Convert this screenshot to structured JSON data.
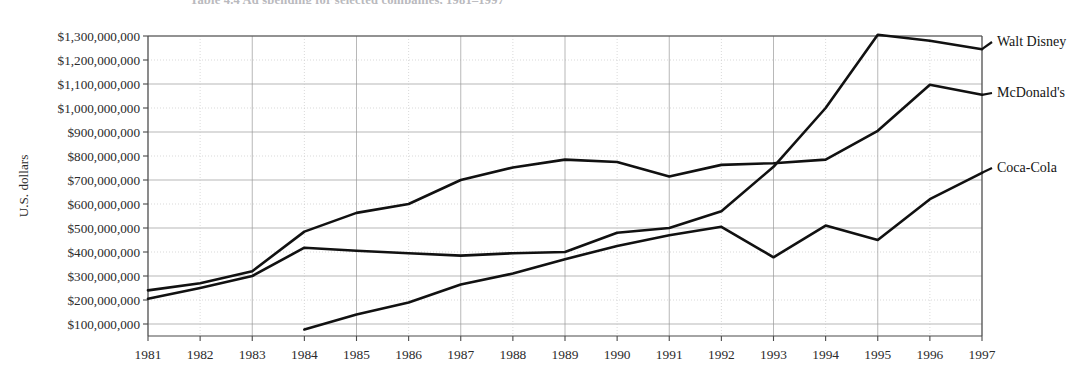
{
  "figure": {
    "caption": "Table 4.4   Ad spending for selected companies, 1981–1997"
  },
  "chart_data": {
    "type": "line",
    "title": "",
    "xlabel": "",
    "ylabel": "U.S. dollars",
    "x": [
      1981,
      1982,
      1983,
      1984,
      1985,
      1986,
      1987,
      1988,
      1989,
      1990,
      1991,
      1992,
      1993,
      1994,
      1995,
      1996,
      1997
    ],
    "xtick_labels": [
      "1981",
      "1982",
      "1983",
      "1984",
      "1985",
      "1986",
      "1987",
      "1988",
      "1989",
      "1990",
      "1991",
      "1992",
      "1993",
      "1994",
      "1995",
      "1996",
      "1997"
    ],
    "ytick_labels": [
      "$1,300,000,000",
      "$1,200,000,000",
      "$1,100,000,000",
      "$1,000,000,000",
      "$900,000,000",
      "$800,000,000",
      "$700,000,000",
      "$600,000,000",
      "$500,000,000",
      "$400,000,000",
      "$300,000,000",
      "$200,000,000",
      "$100,000,000"
    ],
    "ytick_values": [
      1300000000,
      1200000000,
      1100000000,
      1000000000,
      900000000,
      800000000,
      700000000,
      600000000,
      500000000,
      400000000,
      300000000,
      200000000,
      100000000
    ],
    "ylim": [
      0,
      1350000000
    ],
    "xlim": [
      1981,
      1997
    ],
    "grid": true,
    "legend_position": "right-inline",
    "series": [
      {
        "name": "Walt Disney",
        "color": "#111111",
        "x": [
          1981,
          1982,
          1983,
          1984,
          1985,
          1986,
          1987,
          1988,
          1989,
          1990,
          1991,
          1992,
          1993,
          1994,
          1995,
          1996,
          1997
        ],
        "values": [
          205000000,
          250000000,
          300000000,
          418000000,
          405000000,
          395000000,
          385000000,
          395000000,
          400000000,
          480000000,
          500000000,
          570000000,
          755000000,
          1000000000,
          1305000000,
          1280000000,
          1245000000
        ]
      },
      {
        "name": "McDonald's",
        "color": "#111111",
        "x": [
          1981,
          1982,
          1983,
          1984,
          1985,
          1986,
          1987,
          1988,
          1989,
          1990,
          1991,
          1992,
          1993,
          1994,
          1995,
          1996,
          1997
        ],
        "values": [
          240000000,
          270000000,
          320000000,
          485000000,
          563000000,
          600000000,
          700000000,
          752000000,
          785000000,
          775000000,
          715000000,
          763000000,
          770000000,
          785000000,
          905000000,
          1097000000,
          1055000000
        ]
      },
      {
        "name": "Coca-Cola",
        "color": "#111111",
        "x": [
          1984,
          1985,
          1986,
          1987,
          1988,
          1989,
          1990,
          1991,
          1992,
          1993,
          1994,
          1995,
          1996,
          1997
        ],
        "values": [
          77000000,
          140000000,
          190000000,
          265000000,
          310000000,
          370000000,
          425000000,
          470000000,
          505000000,
          378000000,
          510000000,
          450000000,
          620000000,
          730000000
        ]
      }
    ]
  }
}
